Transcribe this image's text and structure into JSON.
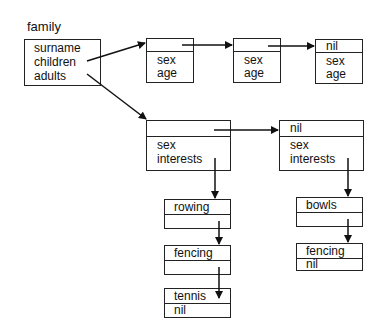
{
  "family": {
    "title": "family",
    "fields": [
      "surname",
      "children",
      "adults"
    ]
  },
  "children": [
    {
      "head": "",
      "fields": [
        "sex",
        "age"
      ]
    },
    {
      "head": "",
      "fields": [
        "sex",
        "age"
      ]
    },
    {
      "head": "nil",
      "fields": [
        "sex",
        "age"
      ]
    }
  ],
  "adults": [
    {
      "head": "",
      "fields": [
        "sex",
        "interests"
      ]
    },
    {
      "head": "nil",
      "fields": [
        "sex",
        "interests"
      ]
    }
  ],
  "interests_a": [
    {
      "value": "rowing",
      "next": ""
    },
    {
      "value": "fencing",
      "next": ""
    },
    {
      "value": "tennis",
      "next": "nil"
    }
  ],
  "interests_b": [
    {
      "value": "bowls",
      "next": ""
    },
    {
      "value": "fencing",
      "next": "nil"
    }
  ]
}
